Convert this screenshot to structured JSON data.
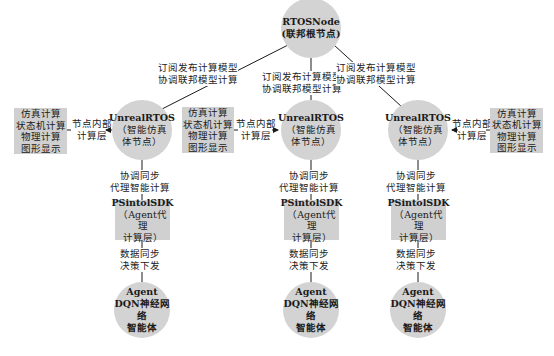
{
  "root": {
    "title": "RTOSNode",
    "subtitle": "(联邦根节点)"
  },
  "federation_links": [
    {
      "line1": "订阅发布计算模型",
      "line2": "协调联邦模型计算"
    },
    {
      "line1": "订阅发布计算模型",
      "line2": "协调联邦模型计算"
    },
    {
      "line1": "订阅发布计算模型",
      "line2": "协调联邦模型计算"
    }
  ],
  "columns": [
    {
      "sim_node": {
        "title": "UnrealRTOS",
        "line2": "（智能仿真",
        "line3": "体节点）"
      },
      "compute_box": {
        "items": [
          "仿真计算",
          "状态机计算",
          "物理计算",
          "图形显示"
        ]
      },
      "inner_link": {
        "line1": "节点内部",
        "line2": "计算层",
        "arrow_direction": "left"
      },
      "agent_link": {
        "line1": "协调同步",
        "line2": "代理智能计算"
      },
      "sdk": {
        "title": "PSintolSDK",
        "line2": "（Agent代理",
        "line3": "计算层）"
      },
      "data_link": {
        "line1": "数据同步",
        "line2": "决策下发"
      },
      "agent": {
        "line1": "Agent",
        "line2": "DQN神经网络",
        "line3": "智能体"
      }
    },
    {
      "sim_node": {
        "title": "UnrealRTOS",
        "line2": "（智能仿真",
        "line3": "体节点）"
      },
      "compute_box": {
        "items": [
          "仿真计算",
          "状态机计算",
          "物理计算",
          "图形显示"
        ]
      },
      "inner_link": {
        "line1": "节点内部",
        "line2": "计算层",
        "arrow_direction": "right"
      },
      "agent_link": {
        "line1": "协调同步",
        "line2": "代理智能计算"
      },
      "sdk": {
        "title": "PSintolSDK",
        "line2": "（Agent代理",
        "line3": "计算层）"
      },
      "data_link": {
        "line1": "数据同步",
        "line2": "决策下发"
      },
      "agent": {
        "line1": "Agent",
        "line2": "DQN神经网络",
        "line3": "智能体"
      }
    },
    {
      "sim_node": {
        "title": "UnrealRTOS",
        "line2": "（智能仿真",
        "line3": "体节点）"
      },
      "compute_box": {
        "items": [
          "仿真计算",
          "状态机计算",
          "物理计算",
          "图形显示"
        ]
      },
      "inner_link": {
        "line1": "节点内部",
        "line2": "计算层",
        "arrow_direction": "left"
      },
      "agent_link": {
        "line1": "协调同步",
        "line2": "代理智能计算"
      },
      "sdk": {
        "title": "PSintolSDK",
        "line2": "（Agent代理",
        "line3": "计算层）"
      },
      "data_link": {
        "line1": "数据同步",
        "line2": "决策下发"
      },
      "agent": {
        "line1": "Agent",
        "line2": "DQN神经网络",
        "line3": "智能体"
      }
    }
  ],
  "colors": {
    "node_fill": "#d3d3d3",
    "box_fill": "#d0d0d0",
    "line": "#1a1a1a"
  }
}
